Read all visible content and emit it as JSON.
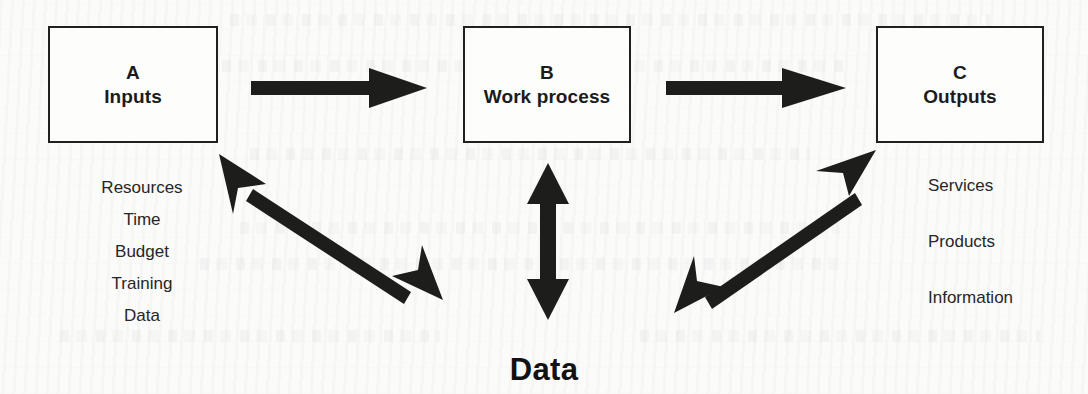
{
  "diagram": {
    "ink_color": "#1d1d1c",
    "background_color": "#fbfbfa",
    "boxes": [
      {
        "letter": "A",
        "title": "Inputs"
      },
      {
        "letter": "B",
        "title": "Work process"
      },
      {
        "letter": "C",
        "title": "Outputs"
      }
    ],
    "inputs_list": [
      "Resources",
      "Time",
      "Budget",
      "Training",
      "Data"
    ],
    "outputs_list": [
      "Services",
      "Products",
      "Information"
    ],
    "bottom_label": "Data",
    "arrows": [
      {
        "name": "a-to-b",
        "kind": "single",
        "direction": "right"
      },
      {
        "name": "b-to-c",
        "kind": "single",
        "direction": "right"
      },
      {
        "name": "a-to-data",
        "kind": "double",
        "direction": "diagonal-down-right"
      },
      {
        "name": "b-to-data",
        "kind": "double",
        "direction": "vertical"
      },
      {
        "name": "data-to-c",
        "kind": "double",
        "direction": "diagonal-up-right"
      }
    ]
  }
}
